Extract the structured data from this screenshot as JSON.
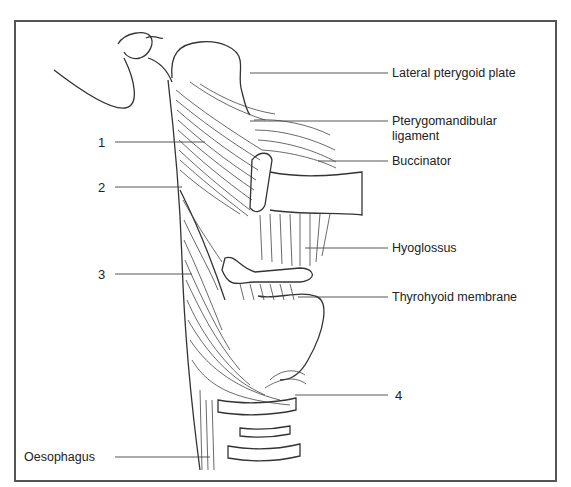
{
  "figure": {
    "labels_right": [
      {
        "id": "lateral-pterygoid-plate",
        "text": "Lateral pterygoid plate"
      },
      {
        "id": "pterygomandibular-ligament",
        "text": "Pterygomandibular",
        "text2": "ligament"
      },
      {
        "id": "buccinator",
        "text": "Buccinator"
      },
      {
        "id": "hyoglossus",
        "text": "Hyoglossus"
      },
      {
        "id": "thyrohyoid-membrane",
        "text": "Thyrohyoid membrane"
      },
      {
        "id": "label-4",
        "text": "4"
      }
    ],
    "labels_left": [
      {
        "id": "label-1",
        "text": "1"
      },
      {
        "id": "label-2",
        "text": "2"
      },
      {
        "id": "label-3",
        "text": "3"
      },
      {
        "id": "oesophagus",
        "text": "Oesophagus"
      }
    ]
  }
}
